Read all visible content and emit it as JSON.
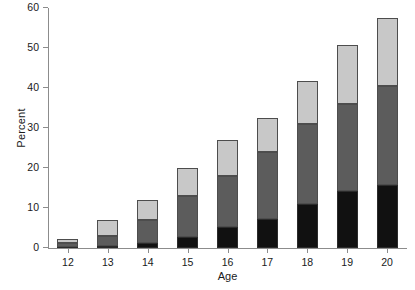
{
  "chart_data": {
    "type": "bar",
    "subtype": "stacked-vertical",
    "title": "",
    "xlabel": "Age",
    "ylabel": "Percent",
    "categories": [
      "12",
      "13",
      "14",
      "15",
      "16",
      "17",
      "18",
      "19",
      "20"
    ],
    "ylim": [
      0,
      60
    ],
    "yticks": [
      0,
      10,
      20,
      30,
      40,
      50,
      60
    ],
    "ytick_labels": [
      "0",
      "10",
      "20",
      "30",
      "40",
      "50",
      "60"
    ],
    "grid": false,
    "legend": "none",
    "series": [
      {
        "name": "bottom-segment",
        "color": "#111111",
        "values": [
          0.3,
          0.5,
          1.3,
          2.8,
          5.3,
          7.3,
          11.0,
          14.3,
          15.8
        ]
      },
      {
        "name": "middle-segment",
        "color": "#5c5c5c",
        "values": [
          1.0,
          2.5,
          5.7,
          10.2,
          12.7,
          16.7,
          20.0,
          21.7,
          24.7
        ]
      },
      {
        "name": "top-segment",
        "color": "#c8c8c8",
        "values": [
          1.0,
          4.0,
          5.0,
          7.0,
          9.0,
          8.5,
          10.8,
          14.8,
          17.0
        ]
      }
    ],
    "totals": [
      2.3,
      7.0,
      12.0,
      20.0,
      27.0,
      32.5,
      41.8,
      50.8,
      57.5
    ]
  },
  "axis_colors": {
    "axis_line": "#8c8c8c",
    "text": "#1a1a1a",
    "background": "#ffffff",
    "bar_outline": "#4d4d4d"
  }
}
